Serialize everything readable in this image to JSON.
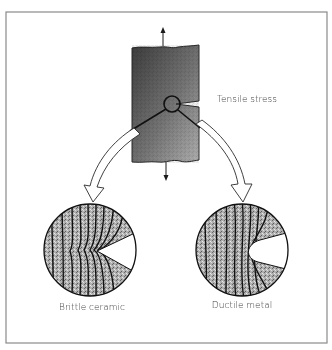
{
  "figure": {
    "labels": {
      "stress": "Tensile stress",
      "left_detail": "Brittle ceramic",
      "right_detail": "Ductile metal"
    },
    "colors": {
      "frame": "#8a8a8a",
      "specimen_dark": "#4a4a4a",
      "specimen_light": "#b4b4b4",
      "detail_fill": "#a8a8a8",
      "line": "#1a1a1a",
      "text": "#3a3a3a"
    },
    "elements": {
      "specimen": "notched bar under tension",
      "stress_arrows": [
        "up",
        "down"
      ],
      "notch_marker": "circle",
      "detail_views": [
        "brittle-ceramic-crack-tip",
        "ductile-metal-blunted-tip"
      ]
    }
  }
}
